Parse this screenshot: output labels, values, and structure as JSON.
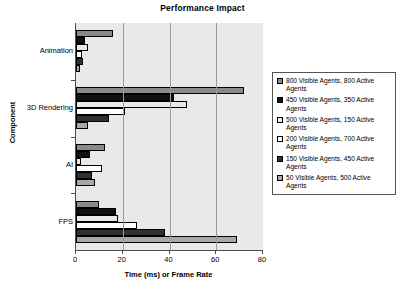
{
  "chart_data": {
    "type": "bar",
    "orientation": "horizontal",
    "title": "Performance Impact",
    "xlabel": "Time (ms) or Frame Rate",
    "ylabel": "Component",
    "categories": [
      "Animation",
      "3D Rendering",
      "AI",
      "FPS"
    ],
    "xlim": [
      0,
      80
    ],
    "xticks": [
      0,
      20,
      40,
      60,
      80
    ],
    "grid": true,
    "legend_position": "right",
    "series": [
      {
        "name": "800 Visible Agents, 800 Active Agents",
        "color": "#8a8a8a",
        "values": [
          16,
          72,
          12.5,
          10
        ]
      },
      {
        "name": "450 Visible Agents, 350 Active Agents",
        "color": "#111111",
        "values": [
          4,
          42,
          6,
          17
        ]
      },
      {
        "name": "500 Visible Agents, 150 Active Agents",
        "color": "#e8e8e8",
        "values": [
          5,
          47.5,
          2,
          18
        ]
      },
      {
        "name": "200 Visible Agents, 700 Active Agents",
        "color": "#ffffff",
        "values": [
          2.5,
          21,
          11,
          26
        ]
      },
      {
        "name": "150 Visible Agents, 450 Active Agents",
        "color": "#303030",
        "values": [
          3,
          14,
          7,
          38
        ]
      },
      {
        "name": "50 Visible Agents, 500 Active Agents",
        "color": "#a8a8a8",
        "values": [
          1.5,
          5,
          8,
          69
        ]
      }
    ]
  },
  "legend": {
    "items": [
      "800 Visible Agents, 800 Active Agents",
      "450 Visible Agents, 350 Active Agents",
      "500 Visible Agents, 150 Active Agents",
      "200 Visible Agents, 700 Active Agents",
      "150 Visible Agents, 450 Active Agents",
      " 50 Visible Agents, 500 Active Agents"
    ]
  },
  "axes": {
    "x_tick_labels": [
      "0",
      "20",
      "40",
      "60",
      "80"
    ],
    "y_tick_labels": [
      "Animation",
      "3D Rendering",
      "AI",
      "FPS"
    ]
  }
}
